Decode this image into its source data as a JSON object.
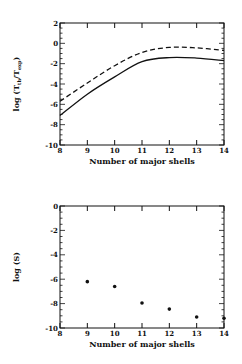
{
  "chart_data": [
    {
      "type": "line",
      "title": "",
      "xlabel": "Number of major shells",
      "ylabel": "log (T_th/T_exp)",
      "ylabel_main": "log (T",
      "ylabel_sub1": "th",
      "ylabel_mid": "/T",
      "ylabel_sub2": "exp",
      "ylabel_end": ")",
      "xlim": [
        8,
        14
      ],
      "ylim": [
        -10,
        2
      ],
      "xticks": [
        "8",
        "9",
        "10",
        "11",
        "12",
        "13",
        "14"
      ],
      "yticks": [
        "2",
        "0",
        "-2",
        "-4",
        "-6",
        "-8",
        "-10"
      ],
      "grid": false,
      "legend": "none",
      "x": [
        8,
        9,
        10,
        11,
        12,
        13,
        14
      ],
      "series": [
        {
          "name": "solid",
          "style": "solid",
          "values": [
            -7.1,
            -5.0,
            -3.3,
            -1.8,
            -1.4,
            -1.45,
            -1.7
          ]
        },
        {
          "name": "dashed",
          "style": "dashed",
          "values": [
            -5.7,
            -3.9,
            -2.2,
            -0.9,
            -0.4,
            -0.45,
            -0.7
          ]
        }
      ]
    },
    {
      "type": "scatter",
      "title": "",
      "xlabel": "Number of major shells",
      "ylabel": "log (S)",
      "xlim": [
        8,
        14
      ],
      "ylim": [
        -10,
        0
      ],
      "xticks": [
        "8",
        "9",
        "10",
        "11",
        "12",
        "13",
        "14"
      ],
      "yticks": [
        "0",
        "-2",
        "-4",
        "-6",
        "-8",
        "-10"
      ],
      "grid": false,
      "legend": "none",
      "x": [
        9,
        10,
        11,
        12,
        13,
        14
      ],
      "series": [
        {
          "name": "log S",
          "values": [
            -6.2,
            -6.6,
            -7.95,
            -8.45,
            -9.1,
            -9.2
          ]
        }
      ]
    }
  ]
}
